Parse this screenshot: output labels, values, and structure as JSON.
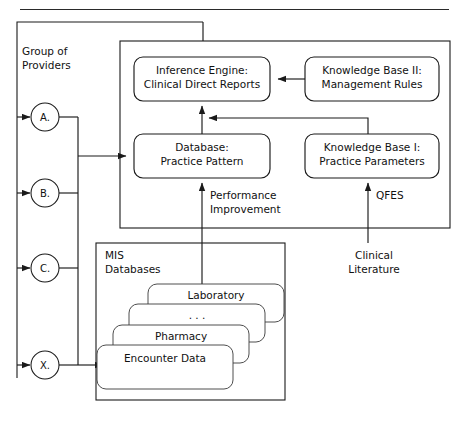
{
  "figure": {
    "top_rule": true
  },
  "providers": {
    "group_label_line1": "Group of",
    "group_label_line2": "Providers",
    "nodes": [
      {
        "id": "a",
        "label": "A.",
        "cx": 45,
        "cy": 117
      },
      {
        "id": "b",
        "label": "B.",
        "cx": 45,
        "cy": 193
      },
      {
        "id": "c",
        "label": "C.",
        "cx": 45,
        "cy": 268
      },
      {
        "id": "x",
        "label": "X.",
        "cx": 45,
        "cy": 365
      }
    ]
  },
  "clinical_system": {
    "boxes": [
      {
        "id": "inference-engine",
        "line1": "Inference Engine:",
        "line2": "Clinical Direct Reports",
        "x": 134,
        "y": 57,
        "w": 136,
        "h": 44
      },
      {
        "id": "knowledge-base-ii",
        "line1": "Knowledge Base II:",
        "line2": "Management Rules",
        "x": 305,
        "y": 57,
        "w": 134,
        "h": 44
      },
      {
        "id": "database-practice-pattern",
        "line1": "Database:",
        "line2": "Practice Pattern",
        "x": 134,
        "y": 134,
        "w": 136,
        "h": 44
      },
      {
        "id": "knowledge-base-i",
        "line1": "Knowledge Base I:",
        "line2": "Practice Parameters",
        "x": 305,
        "y": 134,
        "w": 134,
        "h": 44
      }
    ],
    "annotations": [
      {
        "id": "performance-improvement",
        "line1": "Performance",
        "line2": "Improvement",
        "x": 247,
        "y": 200
      },
      {
        "id": "qfes",
        "line1": "QFES",
        "line2": "",
        "x": 400,
        "y": 200
      },
      {
        "id": "clinical-literature",
        "line1": "Clinical",
        "line2": "Literature",
        "x": 374,
        "y": 262
      }
    ]
  },
  "mis": {
    "title_line1": "MIS",
    "title_line2": "Databases",
    "stack": [
      {
        "id": "laboratory",
        "label": "Laboratory",
        "x": 148,
        "y": 284,
        "w": 136,
        "h": 38
      },
      {
        "id": "ellipsis",
        "label": ". . .",
        "x": 129,
        "y": 304,
        "w": 136,
        "h": 38
      },
      {
        "id": "pharmacy",
        "label": "Pharmacy",
        "x": 113,
        "y": 325,
        "w": 136,
        "h": 38
      },
      {
        "id": "encounter-data",
        "label": "Encounter Data",
        "x": 97,
        "y": 345,
        "w": 136,
        "h": 44
      }
    ]
  },
  "colors": {
    "ink": "#1a1a1a",
    "paper": "#ffffff",
    "thin": "#3a3a3a"
  }
}
